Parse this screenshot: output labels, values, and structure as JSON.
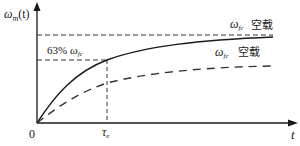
{
  "diagram": {
    "type": "step-response-curves",
    "y_axis_label": {
      "symbol": "ω",
      "sub": "m",
      "suffix": "(t)"
    },
    "x_axis_label": "t",
    "origin_label": "0",
    "tau_label": {
      "symbol": "τ",
      "sub": "e"
    },
    "percent_label": {
      "prefix": "63% ",
      "symbol": "ω",
      "sub": "fc"
    },
    "upper_curve": {
      "asymptote_label": {
        "symbol": "ω",
        "sub": "fc"
      },
      "condition": "空载",
      "style": "solid"
    },
    "lower_curve": {
      "asymptote_label": {
        "symbol": "ω",
        "sub": "fc"
      },
      "condition": "空载",
      "style": "dashed"
    },
    "colors": {
      "line": "#1a1a1a",
      "dash": "#333333"
    }
  }
}
